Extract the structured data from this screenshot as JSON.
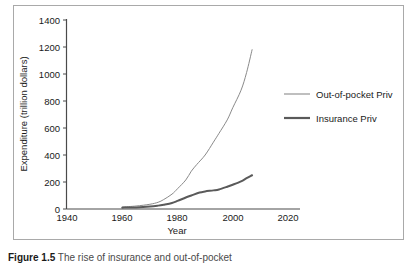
{
  "chart_data": {
    "type": "line",
    "title": "",
    "xlabel": "Year",
    "ylabel": "Expenditure (trillion dollars)",
    "xlim": [
      1940,
      2020
    ],
    "ylim": [
      0,
      1400
    ],
    "xticks": [
      1940,
      1960,
      1980,
      2000,
      2020
    ],
    "yticks": [
      0,
      200,
      400,
      600,
      800,
      1000,
      1200,
      1400
    ],
    "grid": false,
    "legend_position": "right",
    "series": [
      {
        "name": "Out-of-pocket Priv",
        "color": "#8a8a8a",
        "linewidth": 1.0,
        "x": [
          1960,
          1965,
          1970,
          1973,
          1975,
          1978,
          1980,
          1983,
          1985,
          1987,
          1990,
          1993,
          1995,
          1998,
          2000,
          2003,
          2005,
          2007
        ],
        "values": [
          15,
          22,
          35,
          50,
          70,
          110,
          150,
          215,
          280,
          330,
          400,
          495,
          560,
          660,
          750,
          880,
          1010,
          1180
        ]
      },
      {
        "name": "Insurance Priv",
        "color": "#5a5a5a",
        "linewidth": 2.0,
        "x": [
          1960,
          1965,
          1970,
          1973,
          1975,
          1978,
          1980,
          1983,
          1985,
          1988,
          1990,
          1993,
          1995,
          1998,
          2000,
          2003,
          2005,
          2007
        ],
        "values": [
          10,
          12,
          18,
          25,
          32,
          45,
          60,
          85,
          100,
          122,
          130,
          138,
          145,
          165,
          180,
          205,
          228,
          250
        ]
      }
    ]
  },
  "axes": {
    "y_title": "Expenditure (trillion dollars)",
    "x_title": "Year",
    "y_tick_labels": [
      "1400",
      "1200",
      "1000",
      "800",
      "600",
      "400",
      "200",
      "0"
    ],
    "x_tick_labels": [
      "1940",
      "1960",
      "1980",
      "2000",
      "2020"
    ]
  },
  "legend": {
    "items": [
      {
        "label": "Out-of-pocket Priv",
        "color": "#8a8a8a"
      },
      {
        "label": "Insurance Priv",
        "color": "#5a5a5a"
      }
    ]
  },
  "caption": {
    "prefix": "Figure 1.5",
    "text": "The rise of insurance and out-of-pocket"
  },
  "colors": {
    "frame": "#a9a9a9",
    "axis": "#4a4a4a",
    "text": "#1a1a1a",
    "series_light": "#8a8a8a",
    "series_dark": "#5a5a5a"
  }
}
